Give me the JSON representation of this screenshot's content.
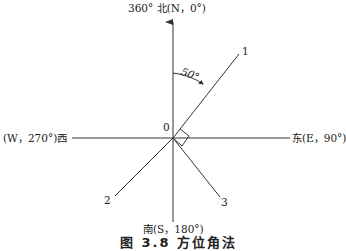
{
  "labels": {
    "north": "360°  北(N，0°)",
    "west": "(W，270°)西",
    "east": "东(E，90°)",
    "south": "南(S，180°)",
    "origin": "0",
    "angle": "50°",
    "line1": "1",
    "line2": "2",
    "line3": "3"
  },
  "caption": "图 3.8   方位角法",
  "geometry": {
    "origin": [
      173,
      138
    ],
    "angle_deg": 50,
    "lines": [
      {
        "id": "1",
        "azimuth_deg": 50
      },
      {
        "id": "2",
        "azimuth_deg": 230
      },
      {
        "id": "3",
        "azimuth_deg": 140
      }
    ]
  },
  "colors": {
    "stroke": "#333333"
  }
}
